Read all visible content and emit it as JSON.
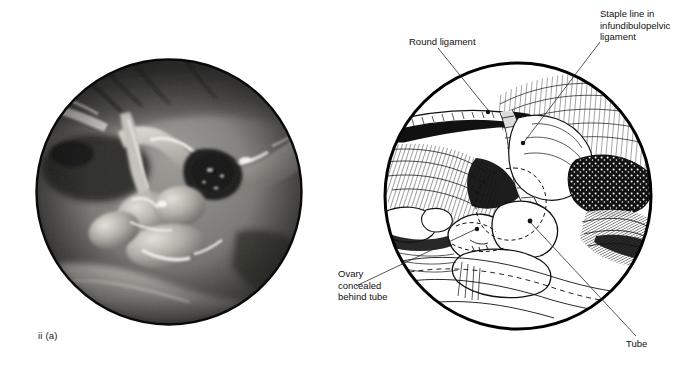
{
  "figure": {
    "panels": [
      {
        "id": "ii-a",
        "caption": "ii (a)",
        "kind": "laparoscopic-photograph",
        "description": "Greyscale endoscopic photograph within a circular field of view showing pelvic peritoneum, vessels and adnexal structures with specular highlights."
      },
      {
        "id": "ii-b",
        "caption": "ii (b)",
        "kind": "line-drawing-schematic",
        "description": "Pen-and-ink hatched line drawing within a circular field of view interpreting the photograph, with leader lines to four annotations."
      }
    ],
    "callouts": [
      {
        "name": "round-ligament",
        "text": "Round ligament",
        "lines": [
          "Round ligament"
        ],
        "leader_target": "upper-left band within drawing circle"
      },
      {
        "name": "staple-line-infundibulopelvic-ligament",
        "text": "Staple line in\ninfundibulopelvic\nligament",
        "lines": [
          "Staple line in",
          "infundibulopelvic",
          "ligament"
        ],
        "leader_target": "central hatched staple band"
      },
      {
        "name": "ovary-concealed-behind-tube",
        "text": "Ovary\nconcealed\nbehind tube",
        "lines": [
          "Ovary",
          "concealed",
          "behind tube"
        ],
        "leader_target": "dashed outline behind tube lobes"
      },
      {
        "name": "tube",
        "text": "Tube",
        "lines": [
          "Tube"
        ],
        "leader_target": "rounded tubal lobe, centre of drawing"
      }
    ],
    "colors": {
      "background": "#ffffff",
      "ink": "#111111",
      "leader_line": "#2b2b2b",
      "circle_border": "#000000",
      "photo_dark": "#1d1d1d",
      "photo_mid": "#8c8c8c",
      "photo_light": "#d8d6d2"
    },
    "geometry": {
      "photo_circle": {
        "cx": 169,
        "cy": 192,
        "r": 133
      },
      "drawing_circle": {
        "cx": 518,
        "cy": 196,
        "r": 135
      }
    }
  }
}
